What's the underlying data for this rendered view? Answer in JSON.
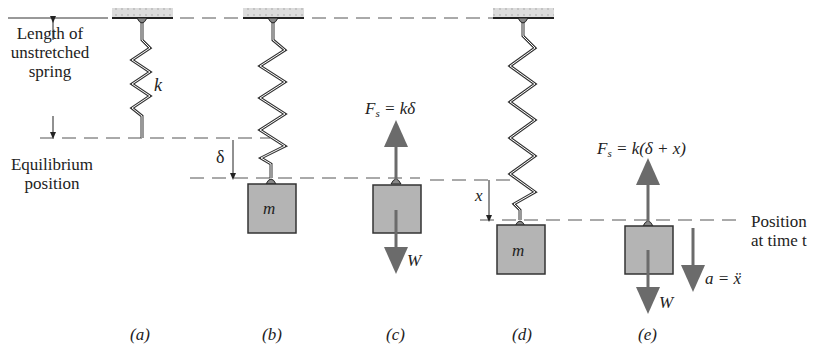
{
  "figure": {
    "left_labels": {
      "unstretched": [
        "Length of",
        "unstretched",
        "spring"
      ],
      "equilibrium": [
        "Equilibrium",
        "position"
      ],
      "delta": "δ"
    },
    "right_labels": {
      "position": [
        "Position",
        "at time t"
      ]
    },
    "panels": [
      {
        "id": "a",
        "caption": "(a)",
        "spring_label": "k"
      },
      {
        "id": "b",
        "caption": "(b)",
        "mass_label": "m"
      },
      {
        "id": "c",
        "caption": "(c)",
        "force_up": {
          "F": "F",
          "sub": "s",
          "rhs": " = kδ"
        },
        "force_down": "W"
      },
      {
        "id": "d",
        "caption": "(d)",
        "mass_label": "m",
        "disp": "x"
      },
      {
        "id": "e",
        "caption": "(e)",
        "force_up": {
          "F": "F",
          "sub": "s",
          "rhs": " = k(δ + x)"
        },
        "force_down": "W",
        "accel": "a = ẍ"
      }
    ],
    "colors": {
      "mass_fill": "#b4b4b4",
      "arrow": "#6b6b6b",
      "line": "#333333",
      "ceiling": "#d6d6d6"
    }
  }
}
